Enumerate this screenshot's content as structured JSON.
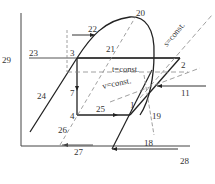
{
  "diagram": {
    "type": "thermodynamic cycle diagram (refrigeration cycle on p-h chart)",
    "colors": {
      "line": "#222222",
      "dashed": "#888888",
      "text": "#333333"
    },
    "axis_labels": {
      "y_axis": "29",
      "x_axis": "28"
    },
    "points": {
      "p1": "1",
      "p2": "2",
      "p3": "3",
      "p4": "4"
    },
    "isoline_labels": {
      "s_const": "s=const.",
      "t_const": "t=const.",
      "v_const": "v=const."
    },
    "callouts": {
      "c7": "7",
      "c11": "11",
      "c18": "18",
      "c19": "19",
      "c20": "20",
      "c21": "21",
      "c22": "22",
      "c23": "23",
      "c24": "24",
      "c25": "25",
      "c26": "26",
      "c27": "27"
    }
  }
}
